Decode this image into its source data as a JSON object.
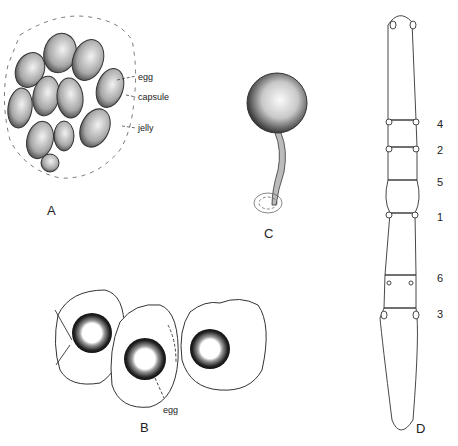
{
  "figure": {
    "panels": [
      {
        "id": "A",
        "label": "A",
        "callouts": [
          "egg",
          "capsule",
          "jelly"
        ]
      },
      {
        "id": "B",
        "label": "B",
        "callouts": [
          "egg"
        ]
      },
      {
        "id": "C",
        "label": "C",
        "callouts": []
      },
      {
        "id": "D",
        "label": "D",
        "segment_numbers": [
          "4",
          "2",
          "5",
          "1",
          "6",
          "3"
        ]
      }
    ],
    "colors": {
      "ink": "#222222",
      "shade": "#8a8a8a",
      "background": "#ffffff"
    }
  }
}
